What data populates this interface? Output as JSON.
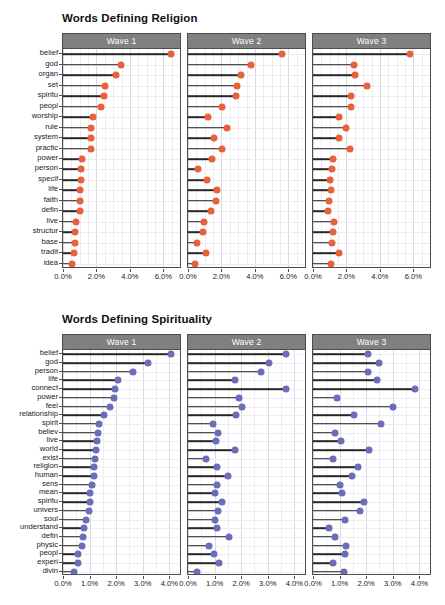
{
  "figure": {
    "width": 445,
    "height": 605,
    "background": "#ffffff"
  },
  "chart_data": [
    {
      "type": "bar",
      "subtype": "lollipop",
      "title": "Words Defining Religion",
      "xlabel": "",
      "ylabel": "",
      "xlim": [
        0.0,
        7.0
      ],
      "xticks": [
        0.0,
        2.0,
        4.0,
        6.0
      ],
      "xticklabels": [
        "0.0%",
        "2.0%",
        "4.0%",
        "6.0%"
      ],
      "grid": true,
      "legend": "none",
      "color": "#e8603c",
      "stem_color": "#262626",
      "strip_background": "#808080",
      "strip_text_color": "#ffffff",
      "facets": [
        "Wave 1",
        "Wave 2",
        "Wave 3"
      ],
      "categories": [
        "belief",
        "god",
        "organ",
        "set",
        "spiritu",
        "peopl",
        "worship",
        "rule",
        "system",
        "practic",
        "power",
        "person",
        "specif",
        "life",
        "faith",
        "defin",
        "live",
        "structur",
        "base",
        "tradit",
        "idea"
      ],
      "series": [
        {
          "name": "Wave 1",
          "values": [
            6.45,
            3.45,
            3.2,
            2.5,
            2.45,
            2.3,
            1.8,
            1.65,
            1.7,
            1.65,
            1.15,
            1.1,
            1.05,
            1.0,
            1.0,
            1.0,
            0.8,
            0.7,
            0.72,
            0.68,
            0.55
          ]
        },
        {
          "name": "Wave 2",
          "values": [
            5.65,
            3.75,
            3.15,
            2.95,
            2.85,
            2.05,
            1.2,
            2.35,
            1.55,
            2.05,
            1.45,
            0.6,
            1.15,
            1.75,
            1.65,
            1.4,
            0.95,
            0.9,
            0.55,
            1.1,
            0.4
          ]
        },
        {
          "name": "Wave 3",
          "values": [
            5.8,
            2.45,
            2.5,
            3.25,
            2.3,
            2.25,
            1.55,
            1.95,
            1.55,
            2.2,
            1.2,
            1.15,
            1.0,
            1.05,
            0.95,
            0.9,
            1.25,
            1.2,
            1.15,
            1.55,
            1.05
          ]
        }
      ]
    },
    {
      "type": "bar",
      "subtype": "lollipop",
      "title": "Words Defining Spirituality",
      "xlabel": "",
      "ylabel": "",
      "xlim": [
        0.0,
        4.4
      ],
      "xticks": [
        0.0,
        1.0,
        2.0,
        3.0,
        4.0
      ],
      "xticklabels": [
        "0.0%",
        "1.0%",
        "2.0%",
        "3.0%",
        "4.0%"
      ],
      "grid": true,
      "legend": "none",
      "color": "#6a6db8",
      "stem_color": "#262626",
      "strip_background": "#808080",
      "strip_text_color": "#ffffff",
      "facets": [
        "Wave 1",
        "Wave 2",
        "Wave 3"
      ],
      "categories": [
        "belief",
        "god",
        "person",
        "life",
        "connect",
        "power",
        "feel",
        "relationship",
        "spirit",
        "believ",
        "live",
        "world",
        "exist",
        "religion",
        "human",
        "sens",
        "mean",
        "spiritu",
        "univers",
        "soul",
        "understand",
        "defin",
        "physic",
        "peopl",
        "experi",
        "divin"
      ],
      "series": [
        {
          "name": "Wave 1",
          "values": [
            4.05,
            3.2,
            2.65,
            2.05,
            1.95,
            1.9,
            1.75,
            1.55,
            1.35,
            1.3,
            1.28,
            1.25,
            1.2,
            1.18,
            1.15,
            1.08,
            1.02,
            1.0,
            0.98,
            0.85,
            0.78,
            0.75,
            0.72,
            0.58,
            0.55,
            0.42
          ]
        },
        {
          "name": "Wave 2",
          "values": [
            3.7,
            3.05,
            2.75,
            1.75,
            3.7,
            1.9,
            2.02,
            1.8,
            0.95,
            1.12,
            1.05,
            1.78,
            0.68,
            1.1,
            1.52,
            1.08,
            1.0,
            1.28,
            1.12,
            1.02,
            1.08,
            1.55,
            0.8,
            0.98,
            1.18,
            0.32
          ]
        },
        {
          "name": "Wave 3",
          "values": [
            2.05,
            2.5,
            2.05,
            2.4,
            3.85,
            0.92,
            3.0,
            1.55,
            2.55,
            0.82,
            1.05,
            2.12,
            0.75,
            1.68,
            1.45,
            1.0,
            1.08,
            1.9,
            1.78,
            1.22,
            0.62,
            0.82,
            1.25,
            1.22,
            0.75,
            1.15
          ]
        }
      ]
    }
  ]
}
